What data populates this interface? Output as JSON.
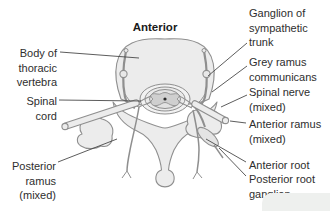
{
  "title": "Anterior",
  "colors": {
    "background": "#ffffff",
    "structure_fill": "#ececec",
    "structure_outline": "#8f8f8f",
    "gray_matter_fill": "#cfcfcf",
    "central_canal": "#2a2a2a",
    "leader_line": "#4a4a4a",
    "label_text": "#2e2e2e"
  },
  "labels": {
    "left": [
      {
        "id": "body-of-thoracic-vertebra",
        "text": "Body of\nthoracic\nvertebra"
      },
      {
        "id": "spinal-cord",
        "text": "Spinal\ncord"
      },
      {
        "id": "posterior-ramus",
        "text": "Posterior\nramus\n(mixed)"
      }
    ],
    "right": [
      {
        "id": "ganglion-of-sympathetic-trunk",
        "text": "Ganglion of\nsympathetic\ntrunk"
      },
      {
        "id": "grey-ramus-communicans",
        "text": "Grey ramus\ncommunicans"
      },
      {
        "id": "spinal-nerve",
        "text": "Spinal nerve\n(mixed)"
      },
      {
        "id": "anterior-ramus",
        "text": "Anterior ramus\n(mixed)"
      },
      {
        "id": "anterior-root",
        "text": "Anterior root"
      },
      {
        "id": "posterior-root-ganglion",
        "text": "Posterior root\nganglion"
      }
    ]
  }
}
